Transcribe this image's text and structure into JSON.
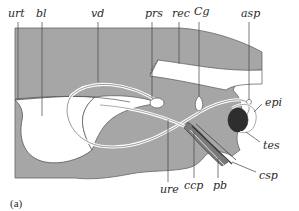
{
  "figure": {
    "caption": "(a)",
    "colors": {
      "body_gray": "#a6a6a6",
      "outline": "#555555",
      "organ_white": "#ffffff",
      "testis_dark": "#2e2e2e",
      "leader_line": "#444444"
    }
  },
  "labels": {
    "urt": "urt",
    "bl": "bl",
    "vd": "vd",
    "prs": "prs",
    "rec": "rec",
    "cg": "Cg",
    "asp": "asp",
    "epi": "epi",
    "tes": "tes",
    "csp": "csp",
    "pb": "pb",
    "ccp": "ccp",
    "ure": "ure"
  }
}
